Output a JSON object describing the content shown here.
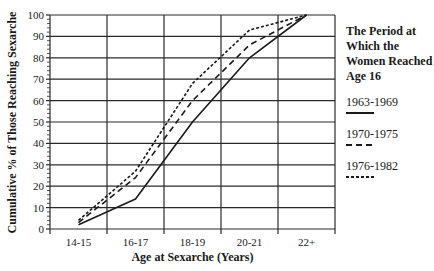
{
  "chart_data": {
    "type": "line",
    "title": "",
    "xlabel": "Age at Sexarche (Years)",
    "ylabel": "Cumulative % of Those Reaching Sexarche",
    "categories": [
      "14-15",
      "16-17",
      "18-19",
      "20-21",
      "22+"
    ],
    "yticks": [
      0,
      10,
      20,
      30,
      40,
      50,
      60,
      70,
      80,
      90,
      100
    ],
    "ylim": [
      0,
      100
    ],
    "grid": true,
    "legend_position": "right",
    "legend_title": "The Period at Which the Women Reached Age 16",
    "series": [
      {
        "name": "1963-1969",
        "style": "solid",
        "values": [
          2,
          14,
          50,
          80,
          100
        ]
      },
      {
        "name": "1970-1975",
        "style": "dashed",
        "values": [
          3,
          24,
          60,
          86,
          100
        ]
      },
      {
        "name": "1976-1982",
        "style": "dotted",
        "values": [
          4,
          27,
          68,
          93,
          100
        ]
      }
    ]
  },
  "labels": {
    "ylabel": "Cumulative % of Those Reaching Sexarche",
    "xlabel": "Age at Sexarche (Years)",
    "legend_title": "The Period at Which the Women Reached Age 16",
    "legend": [
      "1963-1969",
      "1970-1975",
      "1976-1982"
    ]
  },
  "colors": {
    "line": "#1a1a1a",
    "grid": "#2a2a2a",
    "background": "#ffffff"
  }
}
